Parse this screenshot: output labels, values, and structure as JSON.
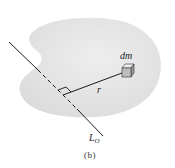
{
  "figure": {
    "caption": "(b)",
    "labels": {
      "mass_element": "dm",
      "distance": "r",
      "axis_main": "L",
      "axis_subscript": "O"
    },
    "colors": {
      "body_fill": "#e6e6e6",
      "line": "#1a1a1a",
      "cube_front": "#b8b8b8",
      "cube_top": "#e8e8e8",
      "cube_side": "#9a9a9a"
    },
    "elements": [
      {
        "name": "rigid-body",
        "description": "irregular blob-shaped rigid body"
      },
      {
        "name": "axis-line",
        "description": "axis L_O passing through body, dashed inside"
      },
      {
        "name": "mass-element",
        "description": "small cube representing dm"
      },
      {
        "name": "distance-line",
        "description": "perpendicular distance r from axis to dm"
      },
      {
        "name": "right-angle-marker",
        "description": "right angle between r and axis"
      }
    ]
  }
}
